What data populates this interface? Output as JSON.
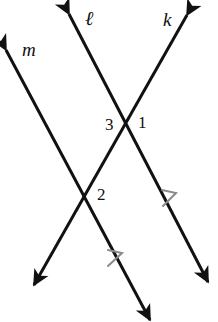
{
  "figure": {
    "type": "geometry-diagram",
    "width": 218,
    "height": 322,
    "background_color": "#ffffff",
    "line_color": "#111111",
    "tick_color": "#8a8a8a",
    "line_width": 3
  },
  "lines": [
    {
      "id": "line-l",
      "label": "ℓ",
      "from": {
        "x": 69,
        "y": 14
      },
      "to": {
        "x": 208,
        "y": 282
      },
      "arrow_start": true,
      "arrow_end": true,
      "parallel_ticks": 1
    },
    {
      "id": "line-k",
      "label": "k",
      "from": {
        "x": 187,
        "y": 15
      },
      "to": {
        "x": 34,
        "y": 285
      },
      "arrow_start": true,
      "arrow_end": true,
      "parallel_ticks": 0
    },
    {
      "id": "line-m",
      "label": "m",
      "from": {
        "x": 6,
        "y": 50
      },
      "to": {
        "x": 150,
        "y": 320
      },
      "arrow_start": true,
      "arrow_end": true,
      "parallel_ticks": 1
    }
  ],
  "intersections": [
    {
      "id": "intersection-upper",
      "x": 126,
      "y": 125,
      "lines": [
        "line-l",
        "line-k"
      ]
    },
    {
      "id": "intersection-lower",
      "x": 86,
      "y": 196,
      "lines": [
        "line-k",
        "line-m"
      ]
    }
  ],
  "angle_labels": [
    {
      "id": "angle-1",
      "text": "1",
      "x": 138,
      "y": 114,
      "at": "intersection-upper",
      "side": "right"
    },
    {
      "id": "angle-3",
      "text": "3",
      "x": 105,
      "y": 116,
      "at": "intersection-upper",
      "side": "left"
    },
    {
      "id": "angle-2",
      "text": "2",
      "x": 97,
      "y": 186,
      "at": "intersection-lower",
      "side": "right"
    }
  ],
  "line_labels": [
    {
      "id": "label-m",
      "text": "m",
      "x": 22,
      "y": 40
    },
    {
      "id": "label-l",
      "text": "ℓ",
      "x": 85,
      "y": 8
    },
    {
      "id": "label-k",
      "text": "k",
      "x": 163,
      "y": 10
    }
  ],
  "parallel_marks": [
    {
      "id": "tick-line-l",
      "x": 173,
      "y": 198,
      "on": "line-l"
    },
    {
      "id": "tick-line-m",
      "x": 118,
      "y": 258,
      "on": "line-m"
    }
  ]
}
